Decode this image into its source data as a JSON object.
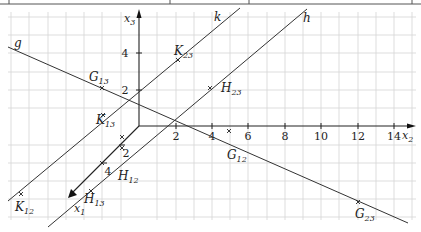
{
  "figure": {
    "type": "3d-coordinate-diagram",
    "grid_spacing_px": 18.2,
    "colors": {
      "grid": "#d0d0d0",
      "axis": "#222222",
      "line": "#333333",
      "background": "#ffffff",
      "table_border": "#555555"
    }
  },
  "axes": {
    "x1": {
      "label": "x",
      "sub": "1",
      "ticks": [
        {
          "value": 2,
          "label": "2"
        },
        {
          "value": 4,
          "label": "4"
        }
      ]
    },
    "x2": {
      "label": "x",
      "sub": "2",
      "ticks": [
        {
          "value": 2,
          "label": "2"
        },
        {
          "value": 4,
          "label": "4"
        },
        {
          "value": 6,
          "label": "6"
        },
        {
          "value": 8,
          "label": "8"
        },
        {
          "value": 10,
          "label": "10"
        },
        {
          "value": 12,
          "label": "12"
        },
        {
          "value": 14,
          "label": "14"
        }
      ]
    },
    "x3": {
      "label": "x",
      "sub": "3",
      "ticks": [
        {
          "value": 2,
          "label": "2"
        },
        {
          "value": 4,
          "label": "4"
        }
      ]
    }
  },
  "lines": [
    {
      "name": "g",
      "label": "g"
    },
    {
      "name": "h",
      "label": "h"
    },
    {
      "name": "k",
      "label": "k"
    }
  ],
  "points": [
    {
      "name": "G13",
      "base": "G",
      "sub": "13"
    },
    {
      "name": "G12",
      "base": "G",
      "sub": "12"
    },
    {
      "name": "G23",
      "base": "G",
      "sub": "23"
    },
    {
      "name": "H23",
      "base": "H",
      "sub": "23"
    },
    {
      "name": "H12",
      "base": "H",
      "sub": "12"
    },
    {
      "name": "H13",
      "base": "H",
      "sub": "13"
    },
    {
      "name": "K23",
      "base": "K",
      "sub": "23"
    },
    {
      "name": "K13",
      "base": "K",
      "sub": "13"
    },
    {
      "name": "K12",
      "base": "K",
      "sub": "12"
    }
  ]
}
